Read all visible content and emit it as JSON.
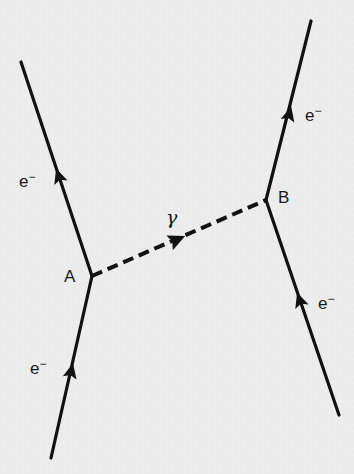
{
  "diagram": {
    "type": "feynman",
    "colors": {
      "background": "#ececec",
      "line": "#111111",
      "text": "#1a1a1a"
    },
    "vertices": [
      {
        "id": "A",
        "label": "A",
        "x": 92,
        "y": 276
      },
      {
        "id": "B",
        "label": "B",
        "x": 266,
        "y": 200
      }
    ],
    "particles": [
      {
        "id": "e_in_A",
        "label_base": "e",
        "label_sup": "−",
        "kind": "fermion",
        "from": [
          51,
          458
        ],
        "to": [
          92,
          276
        ]
      },
      {
        "id": "e_out_A",
        "label_base": "e",
        "label_sup": "−",
        "kind": "fermion",
        "from": [
          92,
          276
        ],
        "to": [
          21,
          62
        ]
      },
      {
        "id": "e_in_B",
        "label_base": "e",
        "label_sup": "−",
        "kind": "fermion",
        "from": [
          339,
          415
        ],
        "to": [
          266,
          200
        ]
      },
      {
        "id": "e_out_B",
        "label_base": "e",
        "label_sup": "−",
        "kind": "fermion",
        "from": [
          266,
          200
        ],
        "to": [
          311,
          21
        ]
      },
      {
        "id": "photon",
        "label": "γ",
        "kind": "photon",
        "style": "dashed",
        "from": [
          92,
          276
        ],
        "to": [
          266,
          200
        ]
      }
    ]
  }
}
